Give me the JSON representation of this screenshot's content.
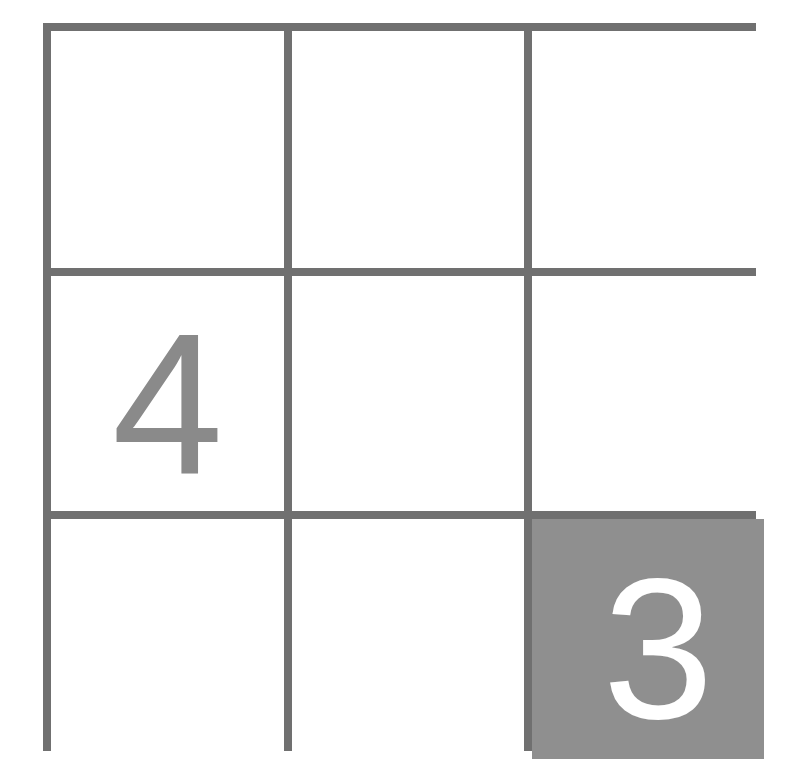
{
  "puzzle": {
    "rows": 3,
    "cols": 3,
    "colors": {
      "grid_line": "#707070",
      "cell_bg": "#ffffff",
      "shaded_bg": "#8f8f8f",
      "given_digit": "#8a8a8a",
      "shaded_digit": "#ffffff"
    },
    "cells": [
      {
        "row": 0,
        "col": 0,
        "value": "",
        "shaded": false
      },
      {
        "row": 0,
        "col": 1,
        "value": "",
        "shaded": false
      },
      {
        "row": 0,
        "col": 2,
        "value": "",
        "shaded": false
      },
      {
        "row": 1,
        "col": 0,
        "value": "4",
        "shaded": false
      },
      {
        "row": 1,
        "col": 1,
        "value": "",
        "shaded": false
      },
      {
        "row": 1,
        "col": 2,
        "value": "",
        "shaded": false
      },
      {
        "row": 2,
        "col": 0,
        "value": "",
        "shaded": false
      },
      {
        "row": 2,
        "col": 1,
        "value": "",
        "shaded": false
      },
      {
        "row": 2,
        "col": 2,
        "value": "3",
        "shaded": true
      }
    ]
  }
}
